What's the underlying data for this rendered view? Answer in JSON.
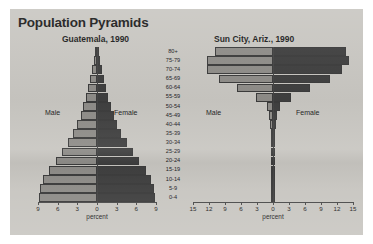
{
  "figure": {
    "title": "Population Pyramids",
    "age_groups": [
      "80+",
      "75-79",
      "70-74",
      "65-69",
      "60-64",
      "55-59",
      "50-54",
      "45-49",
      "40-44",
      "35-39",
      "30-34",
      "25-29",
      "20-24",
      "15-19",
      "10-14",
      "5-9",
      "0-4"
    ],
    "male_label": "Male",
    "female_label": "Female",
    "axis_title": "percent",
    "colors": {
      "background": "#c8c6c1",
      "male_bar": "#8e8c88",
      "female_bar": "#3f3f3f",
      "outline": "#3b3b3b",
      "text": "#1d1d1d"
    }
  },
  "chart_data": [
    {
      "type": "bar",
      "title": "Guatemala, 1990",
      "subtype": "population-pyramid",
      "xlabel": "percent",
      "ylabel": "",
      "categories": [
        "80+",
        "75-79",
        "70-74",
        "65-69",
        "60-64",
        "55-59",
        "50-54",
        "45-49",
        "40-44",
        "35-39",
        "30-34",
        "25-29",
        "20-24",
        "15-19",
        "10-14",
        "5-9",
        "0-4"
      ],
      "xlim": [
        -9,
        9
      ],
      "xticks": [
        9,
        6,
        3,
        0,
        3,
        6,
        9
      ],
      "grid": false,
      "legend": [
        "Male",
        "Female"
      ],
      "legend_position": "inside-left-and-right",
      "series": [
        {
          "name": "Male",
          "values": [
            0.25,
            0.45,
            0.7,
            1.0,
            1.3,
            1.7,
            2.1,
            2.5,
            3.0,
            3.6,
            4.4,
            5.4,
            6.3,
            7.3,
            8.2,
            8.7,
            8.9
          ]
        },
        {
          "name": "Female",
          "values": [
            0.3,
            0.5,
            0.75,
            1.05,
            1.35,
            1.75,
            2.15,
            2.6,
            3.1,
            3.7,
            4.5,
            5.5,
            6.4,
            7.4,
            8.2,
            8.7,
            8.9
          ]
        }
      ]
    },
    {
      "type": "bar",
      "title": "Sun City, Ariz., 1990",
      "subtype": "population-pyramid",
      "xlabel": "percent",
      "ylabel": "",
      "categories": [
        "80+",
        "75-79",
        "70-74",
        "65-69",
        "60-64",
        "55-59",
        "50-54",
        "45-49",
        "40-44",
        "35-39",
        "30-34",
        "25-29",
        "20-24",
        "15-19",
        "10-14",
        "5-9",
        "0-4"
      ],
      "xlim": [
        -15,
        15
      ],
      "xticks": [
        15,
        12,
        9,
        6,
        3,
        0,
        3,
        6,
        9,
        12,
        15
      ],
      "grid": false,
      "legend": [
        "Male",
        "Female"
      ],
      "legend_position": "inside-left-and-right",
      "series": [
        {
          "name": "Male",
          "values": [
            10.8,
            12.4,
            12.3,
            10.2,
            6.8,
            3.1,
            1.2,
            0.7,
            0.5,
            0.4,
            0.35,
            0.3,
            0.3,
            0.3,
            0.3,
            0.25,
            0.2
          ]
        },
        {
          "name": "Female",
          "values": [
            13.6,
            14.2,
            13.0,
            10.6,
            6.9,
            3.3,
            1.3,
            0.8,
            0.55,
            0.45,
            0.4,
            0.35,
            0.3,
            0.3,
            0.3,
            0.25,
            0.2
          ]
        }
      ]
    }
  ]
}
